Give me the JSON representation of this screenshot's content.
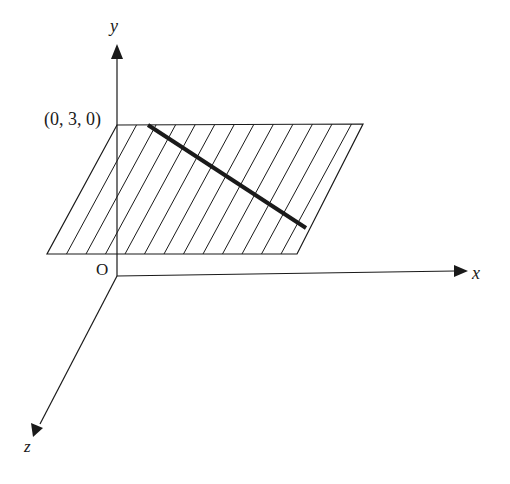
{
  "diagram": {
    "axes": {
      "x_label": "x",
      "y_label": "y",
      "z_label": "z",
      "origin_label": "O"
    },
    "point_label": "(0, 3, 0)",
    "plane": {
      "description": "plane y = 3 drawn as hatched parallelogram",
      "hatch_count": 13
    },
    "line": {
      "description": "thick line lying in the plane"
    },
    "colors": {
      "stroke": "#1a1a1a",
      "background": "#ffffff"
    }
  }
}
